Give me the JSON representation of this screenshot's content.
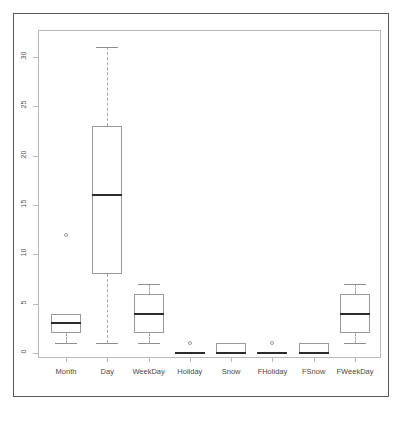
{
  "figure": {
    "background_color": "#ffffff",
    "outer_border_color": "#5a5a5a",
    "frame_color": "#b9b9b9",
    "box_color": "#9a9a9a",
    "median_color": "#2b2b2b",
    "whisker_color": "#a8a8a8"
  },
  "chart_data": {
    "type": "box",
    "title": "",
    "subtitle": "",
    "xlabel": "",
    "ylabel": "",
    "grid": false,
    "legend": "none",
    "ylim": [
      0,
      31
    ],
    "yticks": [
      0,
      5,
      10,
      15,
      20,
      25,
      30
    ],
    "ytick_labels": [
      "0",
      "5",
      "10",
      "15",
      "20",
      "25",
      "30"
    ],
    "categories": [
      "Month",
      "Day",
      "WeekDay",
      "Holiday",
      "Snow",
      "FHoliday",
      "FSnow",
      "FWeekDay"
    ],
    "boxes": [
      {
        "name": "Month",
        "whisker_low": 1,
        "q1": 2,
        "median": 3,
        "q3": 4,
        "whisker_high": 4,
        "outliers": [
          12
        ]
      },
      {
        "name": "Day",
        "whisker_low": 1,
        "q1": 8,
        "median": 16,
        "q3": 23,
        "whisker_high": 31,
        "outliers": []
      },
      {
        "name": "WeekDay",
        "whisker_low": 1,
        "q1": 2,
        "median": 4,
        "q3": 6,
        "whisker_high": 7,
        "outliers": []
      },
      {
        "name": "Holiday",
        "whisker_low": 0,
        "q1": 0,
        "median": 0,
        "q3": 0,
        "whisker_high": 0,
        "outliers": [
          1
        ]
      },
      {
        "name": "Snow",
        "whisker_low": 0,
        "q1": 0,
        "median": 0,
        "q3": 1,
        "whisker_high": 1,
        "outliers": []
      },
      {
        "name": "FHoliday",
        "whisker_low": 0,
        "q1": 0,
        "median": 0,
        "q3": 0,
        "whisker_high": 0,
        "outliers": [
          1
        ]
      },
      {
        "name": "FSnow",
        "whisker_low": 0,
        "q1": 0,
        "median": 0,
        "q3": 1,
        "whisker_high": 1,
        "outliers": []
      },
      {
        "name": "FWeekDay",
        "whisker_low": 1,
        "q1": 2,
        "median": 4,
        "q3": 6,
        "whisker_high": 7,
        "outliers": []
      }
    ]
  }
}
